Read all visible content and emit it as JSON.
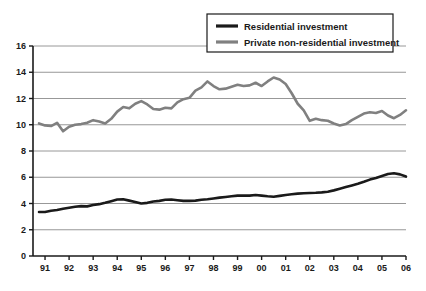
{
  "chart_data": {
    "type": "line",
    "title": "",
    "subtitle": "",
    "xlabel": "",
    "ylabel": "",
    "xlim": [
      1990.5,
      2006.0
    ],
    "ylim": [
      0,
      16
    ],
    "grid": true,
    "grid_axis": "y",
    "legend_position": "top-right",
    "x_tick_labels": [
      "91",
      "92",
      "93",
      "94",
      "95",
      "96",
      "97",
      "98",
      "99",
      "00",
      "01",
      "02",
      "03",
      "04",
      "05",
      "06"
    ],
    "x_tick_values": [
      1991,
      1992,
      1993,
      1994,
      1995,
      1996,
      1997,
      1998,
      1999,
      2000,
      2001,
      2002,
      2003,
      2004,
      2005,
      2006
    ],
    "y_tick_labels": [
      "0",
      "2",
      "4",
      "6",
      "8",
      "10",
      "12",
      "14",
      "16"
    ],
    "y_tick_values": [
      0,
      2,
      4,
      6,
      8,
      10,
      12,
      14,
      16
    ],
    "series": [
      {
        "name": "Residential investment",
        "color": "#1a1a1a",
        "line_width": 2.6,
        "x": [
          1990.75,
          1991.0,
          1991.25,
          1991.5,
          1991.75,
          1992.0,
          1992.25,
          1992.5,
          1992.75,
          1993.0,
          1993.25,
          1993.5,
          1993.75,
          1994.0,
          1994.25,
          1994.5,
          1994.75,
          1995.0,
          1995.25,
          1995.5,
          1995.75,
          1996.0,
          1996.25,
          1996.5,
          1996.75,
          1997.0,
          1997.25,
          1997.5,
          1997.75,
          1998.0,
          1998.25,
          1998.5,
          1998.75,
          1999.0,
          1999.25,
          1999.5,
          1999.75,
          2000.0,
          2000.25,
          2000.5,
          2000.75,
          2001.0,
          2001.25,
          2001.5,
          2001.75,
          2002.0,
          2002.25,
          2002.5,
          2002.75,
          2003.0,
          2003.25,
          2003.5,
          2003.75,
          2004.0,
          2004.25,
          2004.5,
          2004.75,
          2005.0,
          2005.25,
          2005.5,
          2005.75,
          2006.0
        ],
        "values": [
          3.35,
          3.35,
          3.45,
          3.5,
          3.6,
          3.68,
          3.75,
          3.8,
          3.78,
          3.88,
          3.95,
          4.05,
          4.18,
          4.3,
          4.32,
          4.22,
          4.12,
          4.0,
          4.05,
          4.15,
          4.2,
          4.28,
          4.3,
          4.25,
          4.2,
          4.2,
          4.22,
          4.28,
          4.32,
          4.38,
          4.45,
          4.5,
          4.55,
          4.6,
          4.6,
          4.6,
          4.65,
          4.6,
          4.55,
          4.52,
          4.58,
          4.65,
          4.7,
          4.75,
          4.78,
          4.8,
          4.82,
          4.85,
          4.9,
          5.0,
          5.12,
          5.25,
          5.38,
          5.5,
          5.65,
          5.82,
          5.95,
          6.1,
          6.25,
          6.3,
          6.22,
          6.05
        ]
      },
      {
        "name": "Private non-residential investment",
        "color": "#808080",
        "line_width": 2.6,
        "x": [
          1990.75,
          1991.0,
          1991.25,
          1991.5,
          1991.75,
          1992.0,
          1992.25,
          1992.5,
          1992.75,
          1993.0,
          1993.25,
          1993.5,
          1993.75,
          1994.0,
          1994.25,
          1994.5,
          1994.75,
          1995.0,
          1995.25,
          1995.5,
          1995.75,
          1996.0,
          1996.25,
          1996.5,
          1996.75,
          1997.0,
          1997.25,
          1997.5,
          1997.75,
          1998.0,
          1998.25,
          1998.5,
          1998.75,
          1999.0,
          1999.25,
          1999.5,
          1999.75,
          2000.0,
          2000.25,
          2000.5,
          2000.75,
          2001.0,
          2001.25,
          2001.5,
          2001.75,
          2002.0,
          2002.25,
          2002.5,
          2002.75,
          2003.0,
          2003.25,
          2003.5,
          2003.75,
          2004.0,
          2004.25,
          2004.5,
          2004.75,
          2005.0,
          2005.25,
          2005.5,
          2005.75,
          2006.0
        ],
        "values": [
          10.1,
          9.95,
          9.9,
          10.15,
          9.5,
          9.85,
          10.0,
          10.05,
          10.15,
          10.35,
          10.25,
          10.1,
          10.45,
          11.0,
          11.35,
          11.25,
          11.6,
          11.8,
          11.55,
          11.2,
          11.15,
          11.3,
          11.25,
          11.7,
          11.95,
          12.05,
          12.6,
          12.85,
          13.3,
          12.95,
          12.7,
          12.75,
          12.9,
          13.05,
          12.95,
          13.0,
          13.2,
          12.95,
          13.3,
          13.6,
          13.45,
          13.1,
          12.4,
          11.6,
          11.1,
          10.3,
          10.45,
          10.35,
          10.3,
          10.1,
          9.95,
          10.05,
          10.35,
          10.6,
          10.85,
          10.95,
          10.9,
          11.05,
          10.7,
          10.5,
          10.75,
          11.1
        ]
      }
    ]
  },
  "legend": {
    "items": [
      {
        "label": "Residential investment",
        "color": "#1a1a1a"
      },
      {
        "label": "Private non-residential investment",
        "color": "#808080"
      }
    ]
  },
  "colors": {
    "residential": "#1a1a1a",
    "non_residential": "#808080",
    "axis": "#1a1a1a",
    "grid": "#8c8c8c",
    "background": "#ffffff"
  }
}
